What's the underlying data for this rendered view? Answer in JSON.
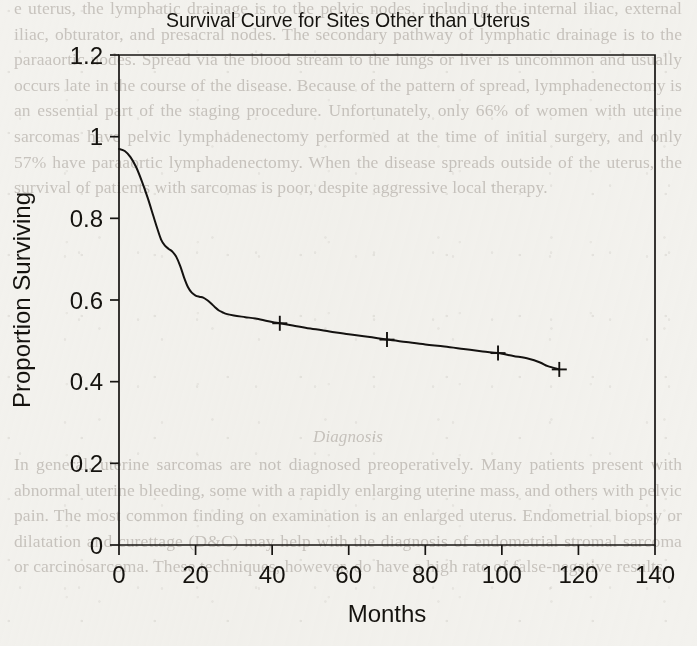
{
  "page": {
    "background_color": "#f3f2ee",
    "ink_color": "#15130f",
    "scan_text_color": "#b9b4ae"
  },
  "scan_text": {
    "top_paragraph": "e uterus, the lymphatic drainage is to the pelvic nodes, including the internal iliac, external iliac, obturator, and presacral nodes. The secondary pathway of lymphatic drainage is to the paraaortic nodes. Spread via the blood stream to the lungs or liver is uncommon and usually occurs late in the course of the disease. Because of the pattern of spread, lymphadenectomy is an essential part of the staging procedure. Unfortunately, only 66% of women with uterine sarcomas have pelvic lymphadenectomy performed at the time of initial surgery, and only 57% have paraaortic lymphadenectomy. When the disease spreads outside of the uterus, the survival of patients with sarcomas is poor, despite aggressive local therapy.",
    "section_heading": "Diagnosis",
    "bottom_paragraph": "In general, uterine sarcomas are not diagnosed preoperatively. Many patients present with abnormal uterine bleeding, some with a rapidly enlarging uterine mass, and others with pelvic pain. The most common finding on examination is an enlarged uterus. Endometrial biopsy or dilatation and curettage (D&C) may help with the diagnosis of endometrial stromal sarcoma or carcinosarcoma. These techniques, however, do have a high rate of false-negative results."
  },
  "chart_data": {
    "type": "line",
    "title": "Survival Curve for Sites Other than Uterus",
    "xlabel": "Months",
    "ylabel": "Proportion Surviving",
    "xlim": [
      0,
      140
    ],
    "ylim": [
      0,
      1.2
    ],
    "xticks": [
      0,
      20,
      40,
      60,
      80,
      100,
      120,
      140
    ],
    "xtick_labels": [
      "0",
      "20",
      "40",
      "60",
      "80",
      "100",
      "120",
      "140"
    ],
    "yticks": [
      0,
      0.2,
      0.4,
      0.6,
      0.8,
      1,
      1.2
    ],
    "ytick_labels": [
      "0",
      "0.2",
      "0.4",
      "0.6",
      "0.8",
      "1",
      "1.2"
    ],
    "grid": false,
    "legend": null,
    "series": [
      {
        "name": "Sites other than uterus",
        "x": [
          0,
          1.5,
          3,
          4.5,
          6,
          7.5,
          9,
          10,
          11,
          12,
          13,
          14,
          15,
          16,
          17,
          18,
          19,
          20,
          21,
          22,
          23,
          24,
          25,
          26,
          27,
          28,
          30,
          33,
          36,
          40,
          42,
          45,
          50,
          55,
          60,
          65,
          70,
          75,
          80,
          85,
          90,
          95,
          99,
          103,
          107,
          110,
          112,
          115
        ],
        "y": [
          0.97,
          0.965,
          0.95,
          0.925,
          0.89,
          0.85,
          0.805,
          0.775,
          0.748,
          0.733,
          0.725,
          0.718,
          0.705,
          0.683,
          0.655,
          0.632,
          0.618,
          0.611,
          0.608,
          0.606,
          0.6,
          0.592,
          0.583,
          0.575,
          0.57,
          0.566,
          0.562,
          0.558,
          0.554,
          0.546,
          0.543,
          0.538,
          0.53,
          0.523,
          0.516,
          0.51,
          0.503,
          0.497,
          0.491,
          0.486,
          0.48,
          0.474,
          0.47,
          0.463,
          0.456,
          0.447,
          0.438,
          0.43
        ]
      }
    ],
    "censor_marks": [
      {
        "x": 42,
        "y": 0.543
      },
      {
        "x": 70,
        "y": 0.503
      },
      {
        "x": 99,
        "y": 0.47
      },
      {
        "x": 115,
        "y": 0.43
      }
    ]
  }
}
